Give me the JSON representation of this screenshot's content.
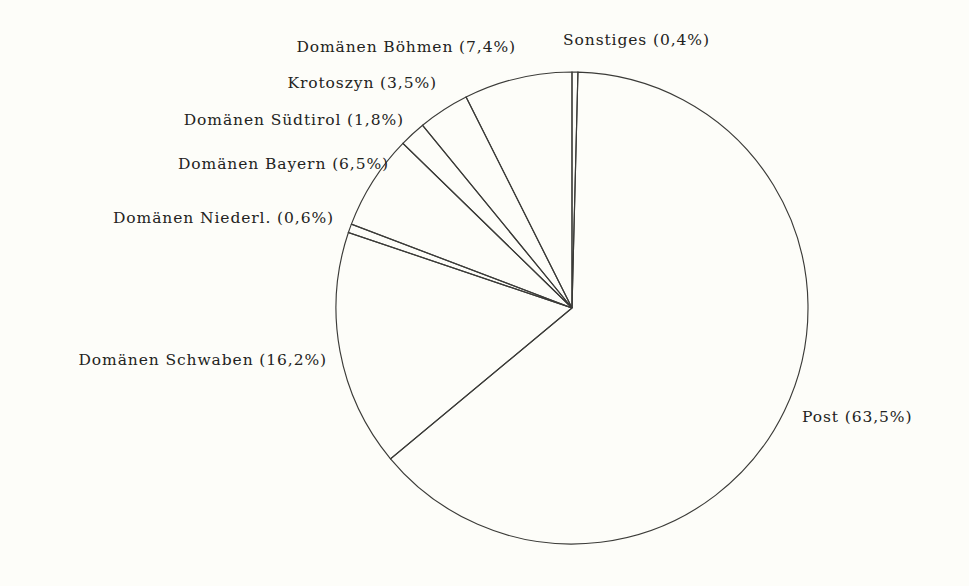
{
  "chart_data": {
    "type": "pie",
    "title": "",
    "subtitle": "",
    "xlabel": "",
    "ylabel": "",
    "legend_position": "none",
    "grid": false,
    "value_unit": "percent",
    "decimal_separator": ",",
    "start_angle_deg": 0,
    "direction": "clockwise",
    "style": "outline-only, no fill, black stroke on cream paper",
    "categories": [
      "Sonstiges",
      "Post",
      "Domänen Schwaben",
      "Domänen Niederl.",
      "Domänen Bayern",
      "Domänen Südtirol",
      "Krotoszyn",
      "Domänen Böhmen"
    ],
    "values": [
      0.4,
      63.5,
      16.2,
      0.6,
      6.5,
      1.8,
      3.5,
      7.4
    ],
    "labels": [
      "Sonstiges (0,4%)",
      "Post (63,5%)",
      "Domänen Schwaben (16,2%)",
      "Domänen Niederl. (0,6%)",
      "Domänen Bayern (6,5%)",
      "Domänen Südtirol (1,8%)",
      "Krotoszyn (3,5%)",
      "Domänen Böhmen (7,4%)"
    ],
    "slices": [
      {
        "name": "Sonstiges",
        "value": 0.4,
        "label": "Sonstiges (0,4%)",
        "label_x": 563,
        "label_y": 33,
        "label_align": "left"
      },
      {
        "name": "Post",
        "value": 63.5,
        "label": "Post (63,5%)",
        "label_x": 802,
        "label_y": 410,
        "label_align": "left"
      },
      {
        "name": "Domänen Schwaben",
        "value": 16.2,
        "label": "Domänen Schwaben (16,2%)",
        "label_x": 327,
        "label_y": 353,
        "label_align": "right"
      },
      {
        "name": "Domänen Niederl.",
        "value": 0.6,
        "label": "Domänen Niederl. (0,6%)",
        "label_x": 334,
        "label_y": 211,
        "label_align": "right"
      },
      {
        "name": "Domänen Bayern",
        "value": 6.5,
        "label": "Domänen Bayern (6,5%)",
        "label_x": 389,
        "label_y": 157,
        "label_align": "right"
      },
      {
        "name": "Domänen Südtirol",
        "value": 1.8,
        "label": "Domänen Südtirol (1,8%)",
        "label_x": 404,
        "label_y": 113,
        "label_align": "right"
      },
      {
        "name": "Krotoszyn",
        "value": 3.5,
        "label": "Krotoszyn (3,5%)",
        "label_x": 437,
        "label_y": 76,
        "label_align": "right"
      },
      {
        "name": "Domänen Böhmen",
        "value": 7.4,
        "label": "Domänen Böhmen (7,4%)",
        "label_x": 516,
        "label_y": 40,
        "label_align": "right"
      }
    ]
  },
  "figure": {
    "center_x": 572,
    "center_y": 308,
    "radius": 236,
    "background_color": "#fdfdf9",
    "stroke_color": "#3b3b38",
    "text_color": "#232321"
  }
}
